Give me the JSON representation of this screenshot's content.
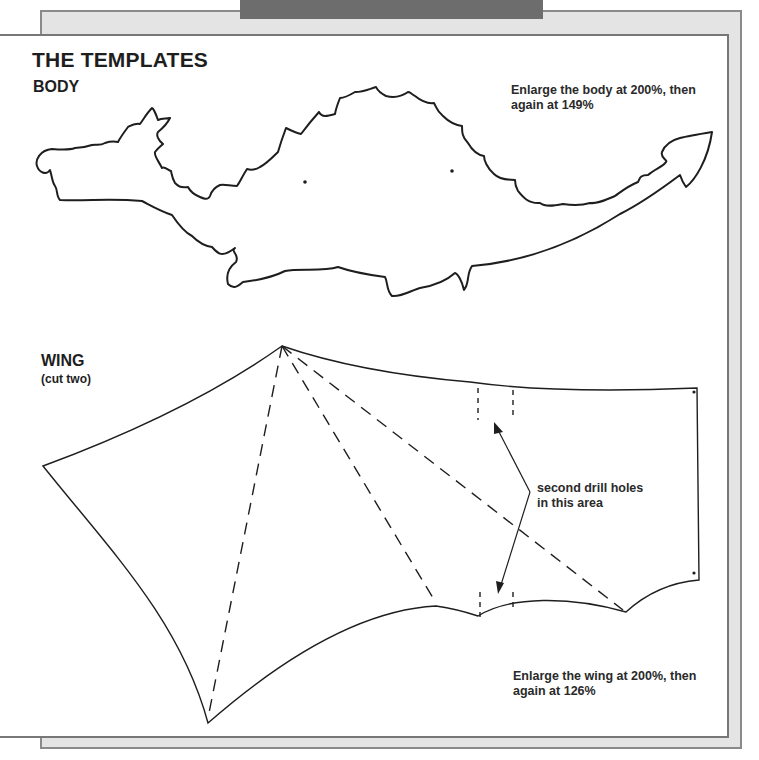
{
  "page": {
    "title": "THE TEMPLATES"
  },
  "body_template": {
    "label": "BODY",
    "note_line1": "Enlarge the body at 200%, then",
    "note_line2": "again at 149%"
  },
  "wing_template": {
    "label": "WING",
    "sub_label": "(cut two)",
    "drill_note_line1": "second drill holes",
    "drill_note_line2": "in this area",
    "note_line1": "Enlarge the wing at 200%, then",
    "note_line2": "again at 126%"
  },
  "colors": {
    "frame_gray": "#e4e4e4",
    "frame_border": "#8a8a8a",
    "tab_dark": "#6d6d6d",
    "line": "#1e1e1e"
  }
}
